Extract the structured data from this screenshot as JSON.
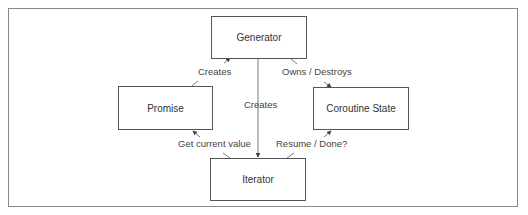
{
  "diagram": {
    "nodes": [
      {
        "id": "generator",
        "label": "Generator"
      },
      {
        "id": "promise",
        "label": "Promise"
      },
      {
        "id": "coroutine_state",
        "label": "Coroutine State"
      },
      {
        "id": "iterator",
        "label": "Iterator"
      }
    ],
    "edges": [
      {
        "from": "promise",
        "to": "generator",
        "label": "Creates"
      },
      {
        "from": "generator",
        "to": "coroutine_state",
        "label": "Owns / Destroys"
      },
      {
        "from": "generator",
        "to": "iterator",
        "label": "Creates"
      },
      {
        "from": "iterator",
        "to": "promise",
        "label": "Get  current value"
      },
      {
        "from": "iterator",
        "to": "coroutine_state",
        "label": "Resume / Done?"
      }
    ]
  }
}
